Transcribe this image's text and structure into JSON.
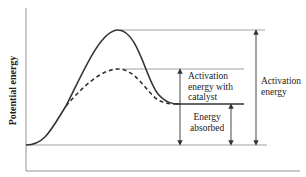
{
  "diagram": {
    "type": "energy-diagram",
    "y_axis_label": "Potential energy",
    "x_axis_label": "",
    "labels": {
      "activation_catalyst_line1": "Activation",
      "activation_catalyst_line2": "energy with",
      "activation_catalyst_line3": "catalyst",
      "energy_absorbed_line1": "Energy",
      "energy_absorbed_line2": "absorbed",
      "activation_line1": "Activation",
      "activation_line2": "energy"
    },
    "curves": [
      {
        "name": "uncatalyzed",
        "style": "solid",
        "peak_y": 30
      },
      {
        "name": "catalyzed",
        "style": "dashed",
        "peak_y": 69
      }
    ],
    "levels": {
      "reactants_y": 145,
      "products_y": 104
    },
    "colors": {
      "curve": "#333333",
      "guide": "#888888",
      "arrow": "#333333"
    }
  }
}
